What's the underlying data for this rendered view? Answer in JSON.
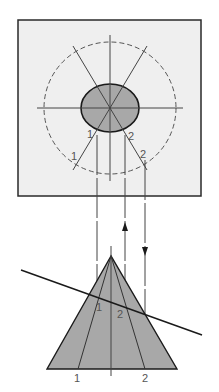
{
  "diagram": {
    "title": "",
    "top_view": {
      "labels": {
        "inner_1": "1",
        "inner_2": "2",
        "outer_1": "1",
        "outer_2": "2"
      }
    },
    "side_view": {
      "labels": {
        "cut_1": "1",
        "cut_2": "2",
        "base_1": "1",
        "base_2": "2"
      }
    },
    "colors": {
      "box_fill": "#efefef",
      "box_stroke": "#2a2a2a",
      "shape_fill": "#a8a8a8",
      "line": "#444444",
      "label": "#555555"
    }
  }
}
